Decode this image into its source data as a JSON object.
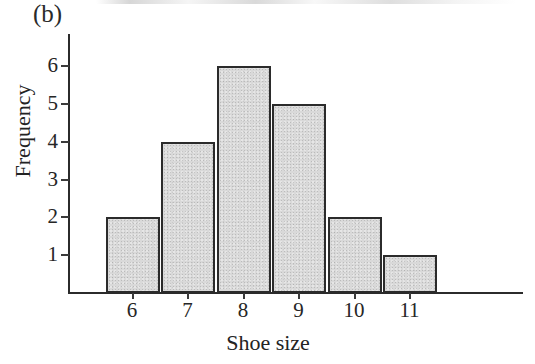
{
  "figure": {
    "panel_label": "(b)",
    "colors": {
      "bar_fill": "#d9d9d9",
      "bar_outline": "#2b2b2b",
      "axis": "#2b2b2b",
      "text": "#232323",
      "background": "#ffffff"
    }
  },
  "chart_data": {
    "type": "bar",
    "title": "",
    "subtitle": "",
    "xlabel": "Shoe size",
    "ylabel": "Frequency",
    "categories": [
      "6",
      "7",
      "8",
      "9",
      "10",
      "11"
    ],
    "values": [
      2,
      4,
      6,
      5,
      2,
      1
    ],
    "series": [
      {
        "name": "Frequency",
        "values": [
          2,
          4,
          6,
          5,
          2,
          1
        ]
      }
    ],
    "xtick_labels": [
      "6",
      "7",
      "8",
      "9",
      "10",
      "11"
    ],
    "ytick_labels": [
      "1",
      "2",
      "3",
      "4",
      "5",
      "6"
    ],
    "ytick_values": [
      1,
      2,
      3,
      4,
      5,
      6
    ],
    "ylim": [
      0,
      6.6
    ],
    "grid": false,
    "legend": false,
    "legend_position": "none",
    "annotations": [
      "(b)"
    ]
  }
}
